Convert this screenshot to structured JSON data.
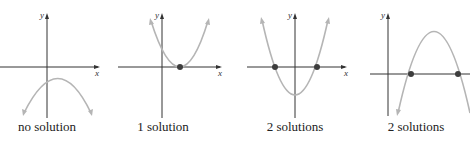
{
  "figure": {
    "panels": [
      {
        "caption": "no solution",
        "x_axis_label": "x",
        "y_axis_label": "y",
        "num_intercepts": 0,
        "opens": "down"
      },
      {
        "caption": "1 solution",
        "x_axis_label": "x",
        "y_axis_label": "y",
        "num_intercepts": 1,
        "opens": "up"
      },
      {
        "caption": "2 solutions",
        "x_axis_label": "x",
        "y_axis_label": "y",
        "num_intercepts": 2,
        "opens": "up"
      },
      {
        "caption": "2 solutions",
        "x_axis_label": "x",
        "y_axis_label": "y",
        "num_intercepts": 2,
        "opens": "down"
      }
    ],
    "colors": {
      "axis": "#333333",
      "curve": "#b5b5b5",
      "intercept_dot": "#3d3d3d"
    }
  }
}
